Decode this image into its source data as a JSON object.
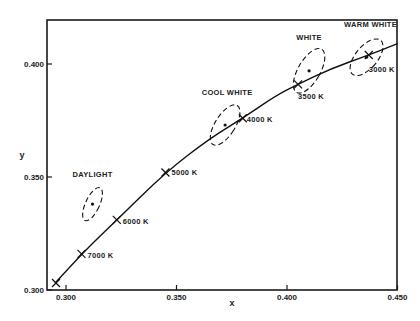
{
  "chart_data": {
    "type": "line",
    "title": "",
    "xlabel": "x",
    "ylabel": "y",
    "xlim": [
      0.2914,
      0.45
    ],
    "ylim": [
      0.3,
      0.42
    ],
    "x_ticks": [
      "0.300",
      "0.350",
      "0.400",
      "0.450"
    ],
    "y_ticks": [
      "0.300",
      "0.350",
      "0.400"
    ],
    "grid": false,
    "series": [
      {
        "name": "Blackbody (Planckian) locus",
        "points": [
          [
            0.295,
            0.303
          ],
          [
            0.307,
            0.316
          ],
          [
            0.323,
            0.331
          ],
          [
            0.345,
            0.352
          ],
          [
            0.365,
            0.367
          ],
          [
            0.38,
            0.376
          ],
          [
            0.395,
            0.386
          ],
          [
            0.405,
            0.391
          ],
          [
            0.42,
            0.398
          ],
          [
            0.437,
            0.404
          ],
          [
            0.45,
            0.409
          ]
        ]
      }
    ],
    "temperature_markers": [
      {
        "label": "7000 K",
        "x": 0.307,
        "y": 0.316
      },
      {
        "label": "6000 K",
        "x": 0.323,
        "y": 0.331
      },
      {
        "label": "5000 K",
        "x": 0.345,
        "y": 0.352
      },
      {
        "label": "4000 K",
        "x": 0.38,
        "y": 0.376
      },
      {
        "label": "3500 K",
        "x": 0.405,
        "y": 0.391
      },
      {
        "label": "3000 K",
        "x": 0.437,
        "y": 0.404
      }
    ],
    "lamp_regions": [
      {
        "label": "DAYLIGHT",
        "x": 0.312,
        "y": 0.338
      },
      {
        "label": "COOL WHITE",
        "x": 0.372,
        "y": 0.373
      },
      {
        "label": "WHITE",
        "x": 0.41,
        "y": 0.397
      },
      {
        "label": "WARM WHITE",
        "x": 0.436,
        "y": 0.403
      }
    ]
  }
}
